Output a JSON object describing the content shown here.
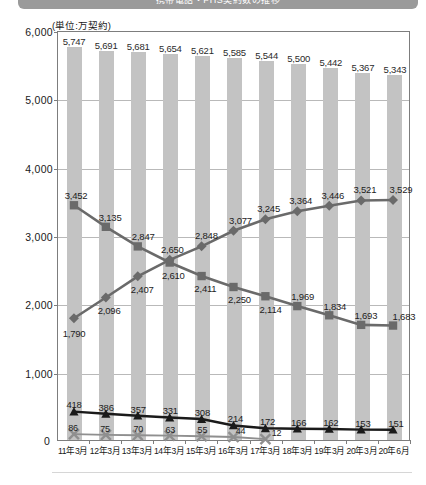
{
  "header": {
    "title": "携帯電話・PHS契約数の推移"
  },
  "chart": {
    "unit_label": "(単位:万契約)",
    "zero_label": "0",
    "colors": {
      "bar": "#c3c3c3",
      "series_down": "#6a6a6a",
      "series_up": "#6a6a6a",
      "series_triangle": "#1a1a1a",
      "series_cross": "#8f8f8f",
      "frame": "#7d7d7d",
      "grid": "#b9b9b9"
    }
  },
  "chart_data": {
    "type": "bar",
    "title": "携帯電話・PHS契約数の推移",
    "xlabel": "",
    "ylabel": "",
    "unit": "万契約",
    "ylim": [
      0,
      6000
    ],
    "ytick_labels": [
      "0",
      "1,000",
      "2,000",
      "3,000",
      "4,000",
      "5,000",
      "6,000"
    ],
    "ytick_values": [
      0,
      1000,
      2000,
      3000,
      4000,
      5000,
      6000
    ],
    "grid": true,
    "legend_position": "none",
    "categories": [
      "11年3月",
      "12年3月",
      "13年3月",
      "14年3月",
      "15年3月",
      "16年3月",
      "17年3月",
      "18年3月",
      "19年3月",
      "20年3月",
      "20年6月"
    ],
    "series": [
      {
        "name": "total-bars",
        "marker": "bar",
        "values": [
          5747,
          5691,
          5681,
          5654,
          5621,
          5585,
          5544,
          5500,
          5442,
          5367,
          5343
        ],
        "labels": [
          "5,747",
          "5,691",
          "5,681",
          "5,654",
          "5,621",
          "5,585",
          "5,544",
          "5,500",
          "5,442",
          "5,367",
          "5,343"
        ]
      },
      {
        "name": "declining-square-line",
        "marker": "square",
        "values": [
          3452,
          3135,
          2847,
          2610,
          2411,
          2250,
          2114,
          1969,
          1834,
          1693,
          1683
        ],
        "labels": [
          "3,452",
          "3,135",
          "2,847",
          "2,610",
          "2,411",
          "2,250",
          "2,114",
          "1,969",
          "1,834",
          "1,693",
          "1,683"
        ]
      },
      {
        "name": "rising-diamond-line",
        "marker": "diamond",
        "values": [
          1790,
          2096,
          2407,
          2650,
          2848,
          3077,
          3245,
          3364,
          3446,
          3521,
          3529
        ],
        "labels": [
          "1,790",
          "2,096",
          "2,407",
          "2,650",
          "2,848",
          "3,077",
          "3,245",
          "3,364",
          "3,446",
          "3,521",
          "3,529"
        ]
      },
      {
        "name": "triangle-line",
        "marker": "triangle",
        "values": [
          418,
          386,
          357,
          331,
          308,
          214,
          172,
          166,
          162,
          153,
          151
        ],
        "labels": [
          "418",
          "386",
          "357",
          "331",
          "308",
          "214",
          "172",
          "166",
          "162",
          "153",
          "151"
        ]
      },
      {
        "name": "cross-line",
        "marker": "cross",
        "values": [
          86,
          75,
          70,
          63,
          55,
          44,
          12,
          null,
          null,
          null,
          null
        ],
        "labels": [
          "86",
          "75",
          "70",
          "63",
          "55",
          "44",
          "12",
          "",
          "",
          "",
          ""
        ]
      }
    ]
  }
}
